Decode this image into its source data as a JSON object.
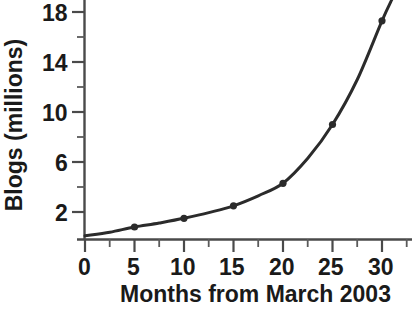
{
  "chart_data": {
    "type": "line",
    "title": "",
    "xlabel": "Months from March 2003",
    "ylabel": "Blogs (millions)",
    "xlim": [
      0,
      32.5
    ],
    "ylim": [
      0,
      19
    ],
    "xticks": [
      0,
      5,
      10,
      15,
      20,
      25,
      30
    ],
    "xtick_labels": [
      "0",
      "5",
      "10",
      "15",
      "20",
      "25",
      "30"
    ],
    "xminor_ticks": [
      2.5,
      7.5,
      12.5,
      17.5,
      22.5,
      27.5,
      32.5
    ],
    "yticks": [
      2,
      6,
      10,
      14,
      18
    ],
    "ytick_labels": [
      "2",
      "6",
      "10",
      "14",
      "18"
    ],
    "yminor_ticks": [
      4,
      8,
      12,
      16
    ],
    "grid": false,
    "legend": "none",
    "series": [
      {
        "name": "Blogs",
        "marker": "circle",
        "color": "#2b2b2b",
        "x": [
          5,
          10,
          15,
          20,
          25,
          30
        ],
        "values": [
          0.8,
          1.5,
          2.5,
          4.3,
          9.0,
          17.3
        ]
      }
    ],
    "curve_points": [
      {
        "x": 0.0,
        "y": 0.1
      },
      {
        "x": 2.5,
        "y": 0.38
      },
      {
        "x": 5.0,
        "y": 0.8
      },
      {
        "x": 7.5,
        "y": 1.12
      },
      {
        "x": 10.0,
        "y": 1.5
      },
      {
        "x": 12.5,
        "y": 1.95
      },
      {
        "x": 15.0,
        "y": 2.5
      },
      {
        "x": 17.5,
        "y": 3.3
      },
      {
        "x": 20.0,
        "y": 4.3
      },
      {
        "x": 22.5,
        "y": 6.3
      },
      {
        "x": 25.0,
        "y": 9.0
      },
      {
        "x": 27.5,
        "y": 12.6
      },
      {
        "x": 30.0,
        "y": 17.3
      },
      {
        "x": 31.0,
        "y": 19.0
      }
    ]
  },
  "axes": {
    "x_title": "Months from March 2003",
    "y_title": "Blogs (millions)",
    "x_tick_labels": [
      "0",
      "5",
      "10",
      "15",
      "20",
      "25",
      "30"
    ],
    "y_tick_labels": [
      "2",
      "6",
      "10",
      "14",
      "18"
    ]
  },
  "colors": {
    "line": "#2b2b2b",
    "axis": "#4a4a4a",
    "text": "#1a1a1a",
    "background": "#ffffff"
  }
}
